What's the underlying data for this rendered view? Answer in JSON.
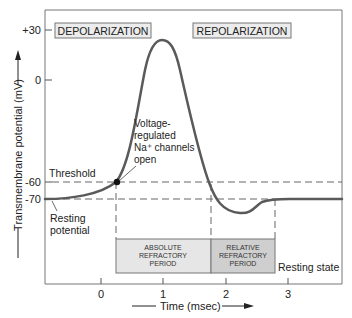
{
  "diagram": {
    "y_axis": {
      "label": "Transmembrane potential (mV)",
      "ticks": [
        {
          "label": "+30",
          "value": 30
        },
        {
          "label": "0",
          "value": 0
        },
        {
          "label": "-60",
          "value": -60
        },
        {
          "label": "-70",
          "value": -70
        }
      ]
    },
    "x_axis": {
      "label": "Time (msec)",
      "ticks": [
        {
          "label": "0",
          "value": 0
        },
        {
          "label": "1",
          "value": 1
        },
        {
          "label": "2",
          "value": 2
        },
        {
          "label": "3",
          "value": 3
        }
      ]
    },
    "phase_labels": {
      "depolarization": "DEPOLARIZATION",
      "repolarization": "REPOLARIZATION"
    },
    "annotations": {
      "threshold": "Threshold",
      "resting_potential_line1": "Resting",
      "resting_potential_line2": "potential",
      "na_channels_line1": "Voltage-",
      "na_channels_line2": "regulated",
      "na_channels_line3": "Na⁺ channels",
      "na_channels_line4": "open",
      "resting_state": "Resting state"
    },
    "refractory_periods": {
      "absolute": {
        "line1": "ABSOLUTE",
        "line2": "REFRACTORY",
        "line3": "PERIOD"
      },
      "relative": {
        "line1": "RELATIVE",
        "line2": "REFRACTORY",
        "line3": "PERIOD"
      }
    },
    "colors": {
      "curve": "#5a5a5a",
      "absolute_box": "#e6e6e6",
      "relative_box": "#cfcfcf",
      "phase_box": "#ececec",
      "frame": "#777777",
      "dashed": "#666666"
    }
  }
}
